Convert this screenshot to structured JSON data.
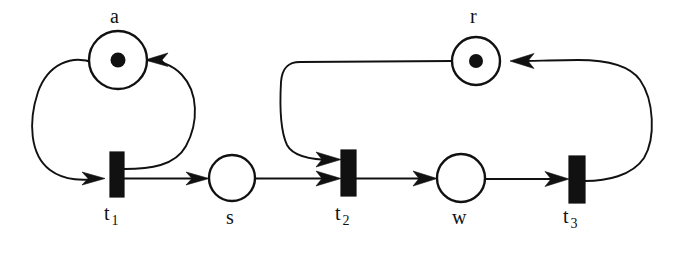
{
  "diagram": {
    "type": "petri-net",
    "title": "",
    "background_color": "#ffffff",
    "ink_color": "#111111",
    "places": [
      {
        "id": "a",
        "label": "a",
        "tokens": 1,
        "cx": 118,
        "cy": 60,
        "r": 29,
        "label_x": 110,
        "label_y": 6
      },
      {
        "id": "s",
        "label": "s",
        "tokens": 0,
        "cx": 232,
        "cy": 178,
        "r": 23,
        "label_x": 226,
        "label_y": 207
      },
      {
        "id": "r",
        "label": "r",
        "tokens": 1,
        "cx": 476,
        "cy": 61,
        "r": 24,
        "label_x": 470,
        "label_y": 6
      },
      {
        "id": "w",
        "label": "w",
        "tokens": 0,
        "cx": 461,
        "cy": 178,
        "r": 24,
        "label_x": 452,
        "label_y": 207
      }
    ],
    "transitions": [
      {
        "id": "t1",
        "label": "t",
        "subscript": "1",
        "x": 110,
        "y": 152,
        "width": 14,
        "height": 45,
        "label_x": 104,
        "label_y": 203
      },
      {
        "id": "t2",
        "label": "t",
        "subscript": "2",
        "x": 341,
        "y": 150,
        "width": 15,
        "height": 46,
        "label_x": 335,
        "label_y": 203
      },
      {
        "id": "t3",
        "label": "t",
        "subscript": "3",
        "x": 569,
        "y": 156,
        "width": 16,
        "height": 47,
        "label_x": 563,
        "label_y": 206
      }
    ],
    "arcs": [
      {
        "id": "a-to-t1",
        "from": "a",
        "to": "t1",
        "shape": "curved-left-loop"
      },
      {
        "id": "t1-to-a",
        "from": "t1",
        "to": "a",
        "shape": "curved-right-loop"
      },
      {
        "id": "t1-to-s",
        "from": "t1",
        "to": "s",
        "shape": "straight"
      },
      {
        "id": "s-to-t2",
        "from": "s",
        "to": "t2",
        "shape": "straight"
      },
      {
        "id": "r-to-t2",
        "from": "r",
        "to": "t2",
        "shape": "curved-left-loop"
      },
      {
        "id": "t2-to-w",
        "from": "t2",
        "to": "w",
        "shape": "straight"
      },
      {
        "id": "w-to-t3",
        "from": "w",
        "to": "t3",
        "shape": "straight"
      },
      {
        "id": "t3-to-r",
        "from": "t3",
        "to": "r",
        "shape": "curved-right-loop"
      }
    ]
  }
}
